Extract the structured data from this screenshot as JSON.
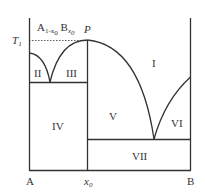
{
  "diagram": {
    "type": "binary phase diagram",
    "compound": {
      "A": "A",
      "sub1": "1-x",
      "sub1b": "0",
      "B": "B",
      "sub2": "x",
      "sub2b": "0"
    },
    "temperature_label": {
      "T": "T",
      "sub": "1"
    },
    "peak_label": "P",
    "axis_labels": {
      "left": "A",
      "mid": "x",
      "mid_sub": "0",
      "right": "B"
    },
    "regions": {
      "r1": "I",
      "r2": "II",
      "r3": "III",
      "r4": "IV",
      "r5": "V",
      "r6": "VI",
      "r7": "VII"
    },
    "colors": {
      "line": "#333333",
      "background": "#ffffff"
    }
  }
}
